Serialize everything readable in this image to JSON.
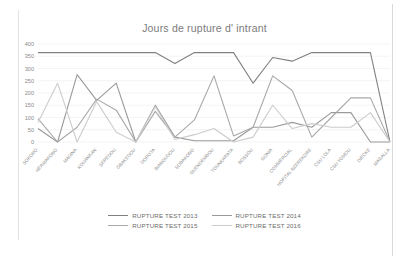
{
  "chart_data": {
    "type": "line",
    "title": "Jours de rupture d' intrant",
    "xlabel": "",
    "ylabel": "",
    "ylim": [
      0,
      400
    ],
    "yticks": [
      0,
      50,
      100,
      150,
      200,
      250,
      300,
      350,
      400
    ],
    "grid": true,
    "legend_position": "bottom",
    "categories": [
      "SOKORO",
      "HERMAKONO",
      "MADINA",
      "KOUANKAN",
      "SEREDOU",
      "GBAKEDOU",
      "DOROTA",
      "BIANOUDOU",
      "SOBAKONO",
      "GUENDEMBOU",
      "TOUNKARATA",
      "BOSSOU",
      "GONIA",
      "COMMERCIAL",
      "HOPITAL NZEREKORE",
      "CSU LOLA",
      "CSU YOMOU",
      "DIECKE",
      "MAGALLA"
    ],
    "series": [
      {
        "name": "RUPTURE TEST 2013",
        "color": "#808080",
        "values": [
          365,
          365,
          365,
          365,
          365,
          365,
          365,
          320,
          365,
          365,
          365,
          240,
          345,
          330,
          365,
          365,
          365,
          365,
          0
        ]
      },
      {
        "name": "RUPTURE TEST 2014",
        "color": "#9a9a9a",
        "values": [
          55,
          0,
          275,
          170,
          240,
          0,
          150,
          20,
          5,
          5,
          5,
          60,
          60,
          80,
          60,
          120,
          120,
          0,
          0
        ]
      },
      {
        "name": "RUPTURE TEST 2015",
        "color": "#a8a8a8",
        "values": [
          95,
          0,
          60,
          175,
          130,
          0,
          125,
          20,
          90,
          270,
          25,
          60,
          270,
          210,
          20,
          100,
          180,
          180,
          0
        ]
      },
      {
        "name": "RUPTURE TEST 2016",
        "color": "#cccccc",
        "values": [
          80,
          240,
          0,
          165,
          40,
          0,
          145,
          10,
          30,
          55,
          0,
          20,
          150,
          55,
          75,
          60,
          60,
          120,
          0
        ]
      }
    ]
  },
  "legend": {
    "items": [
      {
        "label": "RUPTURE TEST 2013",
        "color": "#808080"
      },
      {
        "label": "RUPTURE TEST 2014",
        "color": "#9a9a9a"
      },
      {
        "label": "RUPTURE TEST 2015",
        "color": "#a8a8a8"
      },
      {
        "label": "RUPTURE TEST 2016",
        "color": "#cccccc"
      }
    ]
  }
}
